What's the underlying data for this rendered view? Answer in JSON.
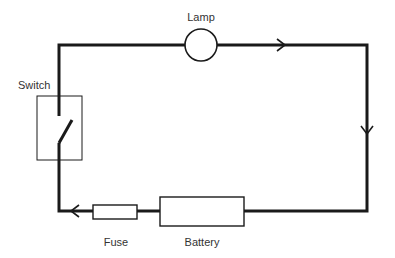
{
  "diagram": {
    "type": "circuit",
    "colors": {
      "wire": "#1a1a1a",
      "component": "#1a1a1a",
      "label": "#333333",
      "background": "#ffffff"
    },
    "components": [
      {
        "id": "lamp",
        "label": "Lamp",
        "shape": "circle"
      },
      {
        "id": "switch",
        "label": "Switch",
        "shape": "open-switch-in-box"
      },
      {
        "id": "fuse",
        "label": "Fuse",
        "shape": "small-rectangle"
      },
      {
        "id": "battery",
        "label": "Battery",
        "shape": "large-rectangle"
      }
    ],
    "current_direction": [
      "top wire: left to right",
      "right wire: top to bottom",
      "bottom wire: right to left"
    ],
    "connections": [
      [
        "switch",
        "lamp"
      ],
      [
        "lamp",
        "battery"
      ],
      [
        "battery",
        "fuse"
      ],
      [
        "fuse",
        "switch"
      ]
    ]
  },
  "labels": {
    "lamp": "Lamp",
    "switch": "Switch",
    "fuse": "Fuse",
    "battery": "Battery"
  }
}
